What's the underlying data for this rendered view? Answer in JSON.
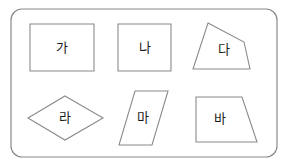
{
  "worksheet": {
    "title": "Korean geometry shape worksheet",
    "background_color": "#ffffff",
    "line_color": "#8a8a8a",
    "label_color": "#1a1a1a",
    "panel": {
      "name": "rounded-panel",
      "x": 11,
      "y": 9,
      "width": 266,
      "height": 148,
      "corner_radius": 11
    },
    "shapes": [
      {
        "id": "ga",
        "label": "가",
        "kind": "rectangle",
        "points": "30,24 94,24 94,71 30,71",
        "label_x": 62,
        "label_y": 48
      },
      {
        "id": "na",
        "label": "나",
        "kind": "square",
        "points": "118,24 171,24 171,71 118,71",
        "label_x": 145,
        "label_y": 48
      },
      {
        "id": "da",
        "label": "다",
        "kind": "irregular-quadrilateral",
        "points": "208,23 244,42 250,69 193,69",
        "label_x": 224,
        "label_y": 50
      },
      {
        "id": "ra",
        "label": "라",
        "kind": "rhombus",
        "points": "65,96 103,118 65,140 28,118",
        "label_x": 65,
        "label_y": 118
      },
      {
        "id": "ma",
        "label": "마",
        "kind": "parallelogram",
        "points": "135,91 168,91 152,145 119,145",
        "label_x": 143,
        "label_y": 118
      },
      {
        "id": "ba",
        "label": "바",
        "kind": "right-trapezoid",
        "points": "196,97 242,97 257,142 196,142",
        "label_x": 220,
        "label_y": 119
      }
    ]
  }
}
